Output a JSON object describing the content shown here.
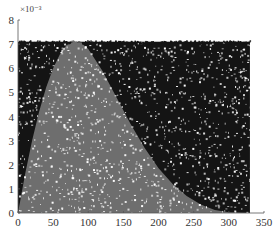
{
  "chart_data": {
    "type": "scatter",
    "title": "",
    "xlabel": "",
    "ylabel": "",
    "y_scale_label": "×10⁻³",
    "y_multiplier": 0.001,
    "xlim": [
      0,
      350
    ],
    "ylim": [
      0,
      8
    ],
    "x_ticks": [
      0,
      50,
      100,
      150,
      200,
      250,
      300,
      350
    ],
    "y_ticks": [
      0,
      1,
      2,
      3,
      4,
      5,
      6,
      7,
      8
    ],
    "grid": false,
    "legend": null,
    "sample_region": {
      "x_range": [
        0,
        330
      ],
      "y_range": [
        0,
        7.1
      ]
    },
    "series": [
      {
        "name": "accepted (below density curve)",
        "color": "#6e6e6e",
        "description": "uniform points under a right-skewed density curve peaking near x≈85, y≈7.1e-3, decaying to ~0 by x≈290"
      },
      {
        "name": "rejected (above density curve)",
        "color": "#141414",
        "description": "uniform points above the density curve within the bounding box"
      }
    ],
    "curve": {
      "x": [
        0,
        10,
        20,
        30,
        40,
        50,
        60,
        70,
        80,
        90,
        100,
        120,
        140,
        160,
        180,
        200,
        220,
        240,
        260,
        280,
        300,
        330
      ],
      "y": [
        0,
        1.6,
        3.0,
        4.2,
        5.2,
        6.0,
        6.6,
        7.0,
        7.1,
        7.05,
        6.8,
        5.9,
        4.8,
        3.7,
        2.7,
        1.85,
        1.2,
        0.7,
        0.35,
        0.12,
        0.03,
        0
      ]
    }
  }
}
